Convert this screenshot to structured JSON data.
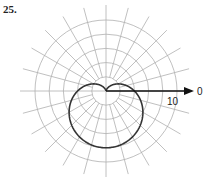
{
  "problem": {
    "number": "25."
  },
  "chart_data": {
    "type": "polar",
    "title": "",
    "curve": {
      "equation": "r = 4(1 - sin θ)",
      "shape": "cardioid",
      "max_r": 8,
      "cusp_at": "origin",
      "opens": "downward"
    },
    "polar_axis": {
      "label": "0",
      "direction": "right",
      "arrow": true
    },
    "radial_tick_label": "10",
    "grid": {
      "circles": [
        2,
        4,
        6,
        8,
        10
      ],
      "spoke_step_deg": 15,
      "r_max": 10
    },
    "colors": {
      "grid": "#b0b0b0",
      "curve": "#333333",
      "axis": "#111111"
    }
  }
}
